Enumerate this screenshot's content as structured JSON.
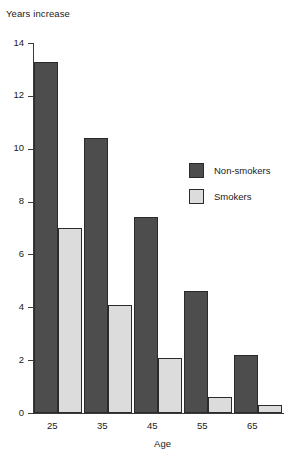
{
  "chart_data": {
    "type": "bar",
    "title": "",
    "ylabel": "Years increase",
    "xlabel": "Age",
    "categories": [
      "25",
      "35",
      "45",
      "55",
      "65"
    ],
    "ylim": [
      0,
      14
    ],
    "yticks": [
      "0",
      "2",
      "4",
      "6",
      "8",
      "10",
      "12",
      "14"
    ],
    "grid": false,
    "legend_position": "inside-right",
    "series": [
      {
        "name": "Non-smokers",
        "color": "#4d4d4d",
        "values": [
          13.3,
          10.4,
          7.4,
          4.6,
          2.2
        ]
      },
      {
        "name": "Smokers",
        "color": "#dcdcdc",
        "values": [
          7.0,
          4.1,
          2.1,
          0.6,
          0.3
        ]
      }
    ]
  }
}
